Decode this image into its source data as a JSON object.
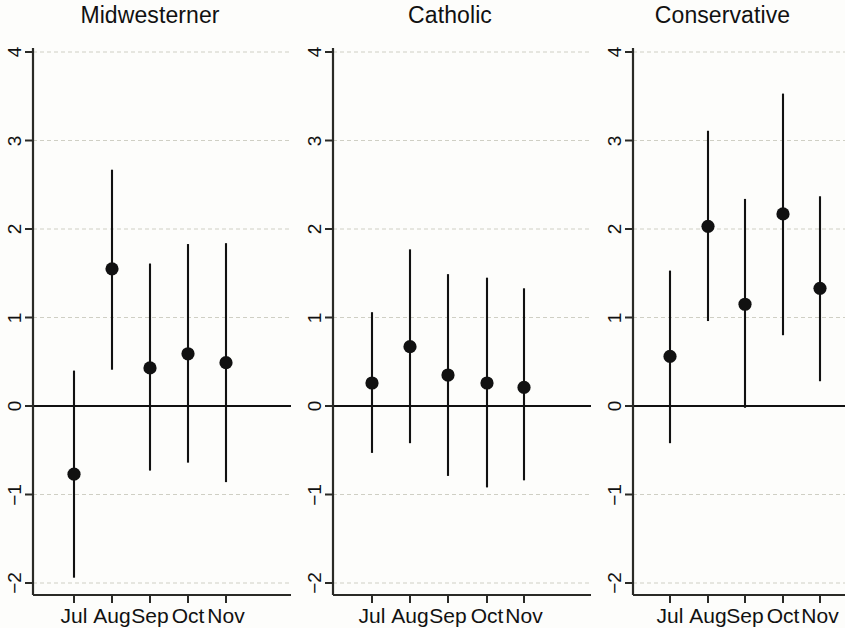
{
  "figure": {
    "width": 845,
    "height": 625,
    "background": "#fdfdfb",
    "ink_color": "#111111",
    "gridline_color": "#cfcfc4"
  },
  "chart_data": {
    "type": "scatter",
    "title": "",
    "subtitle": "",
    "xlabel": "",
    "ylabel": "",
    "ylim": [
      -2,
      4
    ],
    "yticks": [
      4,
      3,
      2,
      1,
      0,
      -1,
      -2
    ],
    "ytick_labels": [
      "4",
      "3",
      "2",
      "1",
      "0",
      "−1",
      "−2"
    ],
    "categories": [
      "Jul",
      "Aug",
      "Sep",
      "Oct",
      "Nov"
    ],
    "grid": "horizontal",
    "legend": "none",
    "zero_reference_line": 0,
    "marker": "filled-circle",
    "error_bar_style": "vertical-line-no-caps",
    "panels": [
      {
        "name": "Midwesterner",
        "title": "Midwesterner",
        "points": [
          {
            "x": "Jul",
            "estimate": -0.77,
            "ci_low": -1.94,
            "ci_high": 0.4
          },
          {
            "x": "Aug",
            "estimate": 1.55,
            "ci_low": 0.41,
            "ci_high": 2.67
          },
          {
            "x": "Sep",
            "estimate": 0.43,
            "ci_low": -0.73,
            "ci_high": 1.61
          },
          {
            "x": "Oct",
            "estimate": 0.59,
            "ci_low": -0.64,
            "ci_high": 1.83
          },
          {
            "x": "Nov",
            "estimate": 0.49,
            "ci_low": -0.86,
            "ci_high": 1.84
          }
        ]
      },
      {
        "name": "Catholic",
        "title": "Catholic",
        "points": [
          {
            "x": "Jul",
            "estimate": 0.26,
            "ci_low": -0.53,
            "ci_high": 1.06
          },
          {
            "x": "Aug",
            "estimate": 0.67,
            "ci_low": -0.42,
            "ci_high": 1.77
          },
          {
            "x": "Sep",
            "estimate": 0.35,
            "ci_low": -0.79,
            "ci_high": 1.49
          },
          {
            "x": "Oct",
            "estimate": 0.26,
            "ci_low": -0.92,
            "ci_high": 1.45
          },
          {
            "x": "Nov",
            "estimate": 0.21,
            "ci_low": -0.84,
            "ci_high": 1.33
          }
        ]
      },
      {
        "name": "Conservative",
        "title": "Conservative",
        "points": [
          {
            "x": "Jul",
            "estimate": 0.56,
            "ci_low": -0.42,
            "ci_high": 1.53
          },
          {
            "x": "Aug",
            "estimate": 2.03,
            "ci_low": 0.96,
            "ci_high": 3.11
          },
          {
            "x": "Sep",
            "estimate": 1.15,
            "ci_low": -0.02,
            "ci_high": 2.34
          },
          {
            "x": "Oct",
            "estimate": 2.17,
            "ci_low": 0.8,
            "ci_high": 3.53
          },
          {
            "x": "Nov",
            "estimate": 1.33,
            "ci_low": 0.28,
            "ci_high": 2.37
          }
        ]
      }
    ]
  },
  "layout": {
    "panel_left": [
      0,
      300,
      600
    ],
    "panel_width": [
      300,
      300,
      245
    ],
    "axis_x": [
      33,
      333,
      633
    ],
    "plot_right": [
      291,
      591,
      845
    ],
    "plot_top": 52,
    "plot_bottom": 583,
    "axis_baseline": 595,
    "px_per_unit": 88.5,
    "y_zero": 406,
    "cat_x": [
      [
        74,
        112,
        150,
        188,
        226
      ],
      [
        372,
        410,
        448,
        487,
        524
      ],
      [
        670,
        708,
        745,
        783,
        820
      ]
    ]
  }
}
